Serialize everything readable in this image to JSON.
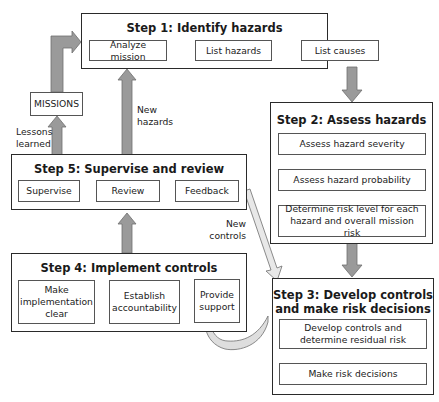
{
  "colors": {
    "border": "#2a2a2a",
    "gray_arrow": "#9a9a9a",
    "gray_arrow_stroke": "#6e6e6e",
    "light_arrow": "#e4e4e4",
    "background": "#ffffff"
  },
  "step1": {
    "title": "Step 1: Identify hazards",
    "boxes": [
      "Analyze mission",
      "List hazards",
      "List causes"
    ]
  },
  "step2": {
    "title": "Step 2: Assess hazards",
    "boxes": [
      "Assess hazard severity",
      "Assess hazard probability",
      "Determine risk level for each hazard and overall mission risk"
    ]
  },
  "step3": {
    "title_line1": "Step 3: Develop controls",
    "title_line2": "and make risk decisions",
    "boxes": [
      "Develop controls and determine residual risk",
      "Make risk decisions"
    ]
  },
  "step4": {
    "title": "Step 4: Implement controls",
    "boxes": [
      "Make implementation clear",
      "Establish accountability",
      "Provide support"
    ]
  },
  "step5": {
    "title": "Step 5: Supervise and review",
    "boxes": [
      "Supervise",
      "Review",
      "Feedback"
    ]
  },
  "missions": {
    "label": "MISSIONS"
  },
  "labels": {
    "lessons_line1": "Lessons",
    "lessons_line2": "learned",
    "new_hazards_line1": "New",
    "new_hazards_line2": "hazards",
    "new_controls_line1": "New",
    "new_controls_line2": "controls"
  }
}
